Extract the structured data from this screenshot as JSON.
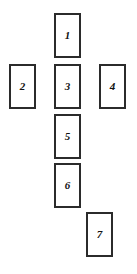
{
  "canvas": {
    "width": 137,
    "height": 274,
    "background_color": "#ffffff"
  },
  "style": {
    "card_border_color": "#2b2b2b",
    "card_fill_color": "#ffffff",
    "label_color": "#111111",
    "card_border_width": 2
  },
  "diagram": {
    "name": "seven-card-spread",
    "card_width": 27,
    "card_height": 45,
    "cards": [
      {
        "id": "card-1",
        "label": "1",
        "x": 54,
        "y": 13,
        "w": 27,
        "h": 45
      },
      {
        "id": "card-2",
        "label": "2",
        "x": 9,
        "y": 64,
        "w": 27,
        "h": 45
      },
      {
        "id": "card-3",
        "label": "3",
        "x": 54,
        "y": 64,
        "w": 27,
        "h": 45
      },
      {
        "id": "card-4",
        "label": "4",
        "x": 99,
        "y": 64,
        "w": 27,
        "h": 45
      },
      {
        "id": "card-5",
        "label": "5",
        "x": 54,
        "y": 114,
        "w": 27,
        "h": 45
      },
      {
        "id": "card-6",
        "label": "6",
        "x": 54,
        "y": 163,
        "w": 27,
        "h": 45
      },
      {
        "id": "card-7",
        "label": "7",
        "x": 86,
        "y": 212,
        "w": 27,
        "h": 45
      }
    ]
  }
}
